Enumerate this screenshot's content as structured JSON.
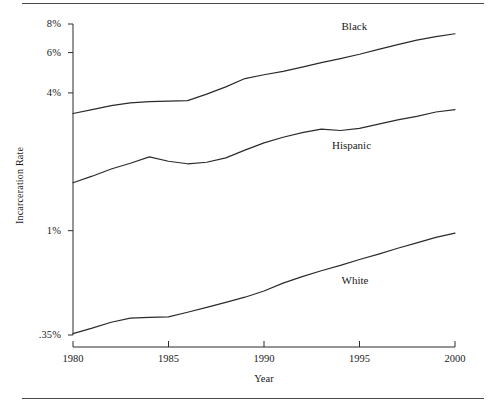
{
  "figure": {
    "has_top_rule": true,
    "has_bottom_rule": true,
    "background_color": "#ffffff",
    "line_color": "#2b2b2b"
  },
  "axes": {
    "y_title": "Incarceration Rate",
    "x_title": "Year",
    "y_tick_labels": [
      "8%",
      "6%",
      "4%",
      "1%",
      ".35%"
    ],
    "x_tick_labels": [
      "1980",
      "1985",
      "1990",
      "1995",
      "2000"
    ]
  },
  "series_labels": {
    "black": "Black",
    "hispanic": "Hispanic",
    "white": "White"
  },
  "chart_data": {
    "type": "line",
    "title": "",
    "xlabel": "Year",
    "ylabel": "Incarceration Rate",
    "yscale": "log",
    "ylim": [
      0.35,
      8.0
    ],
    "xlim": [
      1980,
      2000
    ],
    "grid": false,
    "legend": "inline-labels",
    "y_ticks": [
      8,
      6,
      4,
      1,
      0.35
    ],
    "y_tick_labels": [
      "8%",
      "6%",
      "4%",
      "1%",
      ".35%"
    ],
    "x_ticks": [
      1980,
      1985,
      1990,
      1995,
      2000
    ],
    "x": [
      1980,
      1981,
      1982,
      1983,
      1984,
      1985,
      1986,
      1987,
      1988,
      1989,
      1990,
      1991,
      1992,
      1993,
      1994,
      1995,
      1996,
      1997,
      1998,
      1999,
      2000
    ],
    "units": "percent",
    "series": [
      {
        "name": "Black",
        "label": "Black",
        "values": [
          3.25,
          3.38,
          3.52,
          3.62,
          3.66,
          3.68,
          3.7,
          3.95,
          4.25,
          4.62,
          4.8,
          4.97,
          5.18,
          5.42,
          5.65,
          5.9,
          6.2,
          6.5,
          6.8,
          7.05,
          7.25
        ]
      },
      {
        "name": "Hispanic",
        "label": "Hispanic",
        "values": [
          1.62,
          1.73,
          1.86,
          1.97,
          2.1,
          2.01,
          1.96,
          1.99,
          2.08,
          2.25,
          2.42,
          2.56,
          2.68,
          2.78,
          2.74,
          2.8,
          2.92,
          3.05,
          3.16,
          3.3,
          3.38
        ]
      },
      {
        "name": "White",
        "label": "White",
        "values": [
          0.355,
          0.375,
          0.398,
          0.415,
          0.418,
          0.42,
          0.44,
          0.462,
          0.486,
          0.512,
          0.545,
          0.59,
          0.63,
          0.668,
          0.705,
          0.748,
          0.79,
          0.838,
          0.885,
          0.935,
          0.975
        ]
      }
    ],
    "annotations": [
      {
        "text": "Black",
        "x": 1995,
        "y": 7.8
      },
      {
        "text": "Hispanic",
        "x": 1994.5,
        "y": 2.35
      },
      {
        "text": "White",
        "x": 1995,
        "y": 0.6
      }
    ]
  }
}
